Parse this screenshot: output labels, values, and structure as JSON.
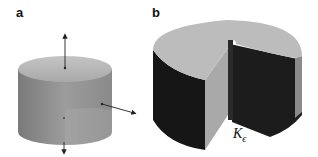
{
  "figure": {
    "panels": [
      {
        "label": "a",
        "description": "solid cylinder with normal vector arrows on top, side and bottom"
      },
      {
        "label": "b",
        "description": "cylinder with wedge-shaped cutout (slit domain)"
      }
    ],
    "annotation": {
      "symbol": "K",
      "subscript": "ϵ"
    },
    "colors": {
      "top_face": "#b9b9b9",
      "side_face": "#8e8e8e",
      "dark_face": "#1a1a1a",
      "cut_face": "#a8a8a8",
      "arrow": "#222222"
    }
  }
}
